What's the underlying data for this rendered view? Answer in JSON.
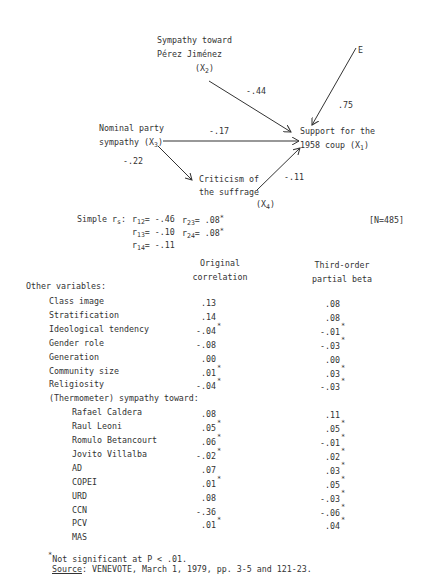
{
  "diagram": {
    "nodes": {
      "x2": {
        "line1": "Sympathy toward",
        "line2": "Pérez Jiménez",
        "label": "(X",
        "sub": "2",
        "close": ")"
      },
      "x3": {
        "line1": "Nominal party",
        "line2": "sympathy (X",
        "sub": "3",
        "close": ")"
      },
      "x4": {
        "line1": "Criticism of",
        "line2": "the suffrage",
        "label": "(X",
        "sub": "4",
        "close": ")"
      },
      "x1": {
        "line1": "Support for the",
        "line2": "1958 coup (X",
        "sub": "1",
        "close": ")"
      },
      "e": {
        "label": "E"
      }
    },
    "paths": {
      "x2_x1": "-.44",
      "e_x1": ".75",
      "x3_x1": "-.17",
      "x3_x4": "-.22",
      "x4_x1": "-.11"
    }
  },
  "simple_r": {
    "label": "Simple r",
    "label_sub": "s",
    "colon": ":",
    "items": [
      {
        "r": "r",
        "sub": "12",
        "val": "= -.46",
        "sig": ""
      },
      {
        "r": "r",
        "sub": "13",
        "val": "= -.10",
        "sig": ""
      },
      {
        "r": "r",
        "sub": "14",
        "val": "= -.11",
        "sig": ""
      },
      {
        "r": "r",
        "sub": "23",
        "val": "= .08",
        "sig": "*"
      },
      {
        "r": "r",
        "sub": "24",
        "val": "= .08",
        "sig": "*"
      }
    ],
    "n": "[N=485]"
  },
  "table": {
    "col1_line1": "Original",
    "col1_line2": "correlation",
    "col2_line1": "Third-order",
    "col2_line2": "partial beta",
    "section_label": "Other variables:",
    "rows": [
      {
        "label": "Class image",
        "orig": ".13",
        "orig_sig": "",
        "beta": ".08",
        "beta_sig": ""
      },
      {
        "label": "Stratification",
        "orig": ".14",
        "orig_sig": "",
        "beta": ".08",
        "beta_sig": ""
      },
      {
        "label": "Ideological tendency",
        "orig": "-.04",
        "orig_sig": "*",
        "beta": "-.01",
        "beta_sig": "*"
      },
      {
        "label": "Gender role",
        "orig": "-.08",
        "orig_sig": "",
        "beta": "-.03",
        "beta_sig": "*"
      },
      {
        "label": "Generation",
        "orig": ".00",
        "orig_sig": "",
        "beta": ".00",
        "beta_sig": ""
      },
      {
        "label": "Community size",
        "orig": ".01",
        "orig_sig": "*",
        "beta": ".03",
        "beta_sig": "*"
      },
      {
        "label": "Religiosity",
        "orig": "-.04",
        "orig_sig": "*",
        "beta": "-.03",
        "beta_sig": "*"
      },
      {
        "label": "(Thermometer) sympathy toward:",
        "orig": "",
        "orig_sig": "",
        "beta": "",
        "beta_sig": ""
      },
      {
        "label": "Rafael Caldera",
        "orig": ".08",
        "orig_sig": "",
        "beta": ".11",
        "beta_sig": ""
      },
      {
        "label": "Raul Leoni",
        "orig": ".05",
        "orig_sig": "*",
        "beta": ".05",
        "beta_sig": "*"
      },
      {
        "label": "Romulo Betancourt",
        "orig": ".06",
        "orig_sig": "*",
        "beta": "-.01",
        "beta_sig": "*"
      },
      {
        "label": "Jovito Villalba",
        "orig": "-.02",
        "orig_sig": "*",
        "beta": ".02",
        "beta_sig": "*"
      },
      {
        "label": "AD",
        "orig": ".07",
        "orig_sig": "",
        "beta": ".03",
        "beta_sig": "*"
      },
      {
        "label": "COPEI",
        "orig": ".01",
        "orig_sig": "*",
        "beta": ".05",
        "beta_sig": "*"
      },
      {
        "label": "URD",
        "orig": ".08",
        "orig_sig": "",
        "beta": "-.03",
        "beta_sig": "*"
      },
      {
        "label": "CCN",
        "orig": "-.36",
        "orig_sig": "",
        "beta": "-.06",
        "beta_sig": "*"
      },
      {
        "label": "PCV",
        "orig": ".01",
        "orig_sig": "*",
        "beta": ".04",
        "beta_sig": "*"
      },
      {
        "label": "MAS",
        "orig": "",
        "orig_sig": "",
        "beta": "",
        "beta_sig": ""
      }
    ]
  },
  "footnotes": {
    "star": "*",
    "note": "Not significant at P < .01.",
    "source_label": "Source",
    "source_text": ":  VENEVOTE, March 1, 1979, pp. 3-5 and 121-23."
  }
}
